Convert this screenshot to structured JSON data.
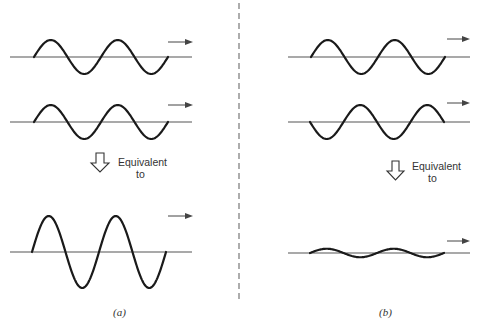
{
  "figure": {
    "divider": "dashed-vertical-line",
    "panels": [
      {
        "id": "a",
        "caption": "(a)",
        "description": "Constructive interference: two in-phase waves combine to a wave of double amplitude",
        "equivalent_label_line1": "Equivalent",
        "equivalent_label_line2": "to",
        "waves": [
          {
            "name": "input-wave-1",
            "amplitude": 1,
            "phase": "in-phase",
            "cycles": 2,
            "direction": "right"
          },
          {
            "name": "input-wave-2",
            "amplitude": 1,
            "phase": "in-phase",
            "cycles": 2,
            "direction": "right"
          },
          {
            "name": "resultant-wave",
            "amplitude": 2,
            "phase": "in-phase",
            "cycles": 2,
            "direction": "right"
          }
        ]
      },
      {
        "id": "b",
        "caption": "(b)",
        "description": "Destructive interference: two out-of-phase waves combine to a wave of reduced amplitude",
        "equivalent_label_line1": "Equivalent",
        "equivalent_label_line2": "to",
        "waves": [
          {
            "name": "input-wave-1",
            "amplitude": 1,
            "phase": "0",
            "cycles": 2,
            "direction": "right"
          },
          {
            "name": "input-wave-2",
            "amplitude": 1,
            "phase": "inverted",
            "cycles": 2,
            "direction": "right"
          },
          {
            "name": "resultant-wave",
            "amplitude": 0.25,
            "phase": "0",
            "cycles": 2,
            "direction": "right"
          }
        ]
      }
    ]
  }
}
